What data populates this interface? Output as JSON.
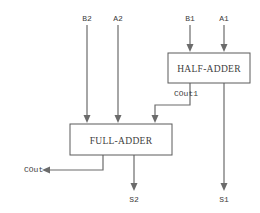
{
  "diagram": {
    "canvas": {
      "width": 260,
      "height": 213,
      "background": "#ffffff"
    },
    "colors": {
      "wire": "#6b6b6b",
      "box_stroke": "#5a5a5a",
      "text": "#3d3d3d",
      "background": "#ffffff"
    },
    "blocks": [
      {
        "id": "half-adder",
        "label": "HALF-ADDER",
        "x": 168,
        "y": 53,
        "width": 82,
        "height": 30,
        "label_x": 209,
        "label_y": 72
      },
      {
        "id": "full-adder",
        "label": "FULL-ADDER",
        "x": 70,
        "y": 124,
        "width": 102,
        "height": 31,
        "label_x": 121,
        "label_y": 144
      }
    ],
    "signals": [
      {
        "id": "b2",
        "label": "B2",
        "label_x": 87,
        "label_y": 21,
        "kind": "input"
      },
      {
        "id": "a2",
        "label": "A2",
        "label_x": 118,
        "label_y": 21,
        "kind": "input"
      },
      {
        "id": "b1",
        "label": "B1",
        "label_x": 190,
        "label_y": 21,
        "kind": "input"
      },
      {
        "id": "a1",
        "label": "A1",
        "label_x": 224,
        "label_y": 21,
        "kind": "input"
      },
      {
        "id": "cout1",
        "label": "COut1",
        "label_x": 174,
        "label_y": 96,
        "kind": "internal"
      },
      {
        "id": "cout",
        "label": "COut",
        "label_x": 24,
        "label_y": 172,
        "kind": "output"
      },
      {
        "id": "s2",
        "label": "S2",
        "label_x": 134,
        "label_y": 202,
        "kind": "output"
      },
      {
        "id": "s1",
        "label": "S1",
        "label_x": 224,
        "label_y": 202,
        "kind": "output"
      }
    ],
    "wires": [
      {
        "id": "wire-b2",
        "path": "M 87 25 L 87 115",
        "arrow_at": {
          "x": 87,
          "y": 123
        }
      },
      {
        "id": "wire-a2",
        "path": "M 118 25 L 118 115",
        "arrow_at": {
          "x": 118,
          "y": 123
        }
      },
      {
        "id": "wire-b1",
        "path": "M 190 25 L 190 45",
        "arrow_at": {
          "x": 190,
          "y": 52
        }
      },
      {
        "id": "wire-a1",
        "path": "M 224 25 L 224 45",
        "arrow_at": {
          "x": 224,
          "y": 52
        }
      },
      {
        "id": "wire-cout1",
        "path": "M 190 83 L 190 105 L 155 105 L 155 115",
        "arrow_at": {
          "x": 155,
          "y": 123
        }
      },
      {
        "id": "wire-cout",
        "path": "M 103 155 L 103 170 L 50 170",
        "arrow_at": {
          "x": 42,
          "y": 170
        }
      },
      {
        "id": "wire-s2",
        "path": "M 134 155 L 134 183",
        "arrow_at": {
          "x": 134,
          "y": 191
        }
      },
      {
        "id": "wire-s1",
        "path": "M 224 83 L 224 183",
        "arrow_at": {
          "x": 224,
          "y": 191
        }
      }
    ]
  }
}
